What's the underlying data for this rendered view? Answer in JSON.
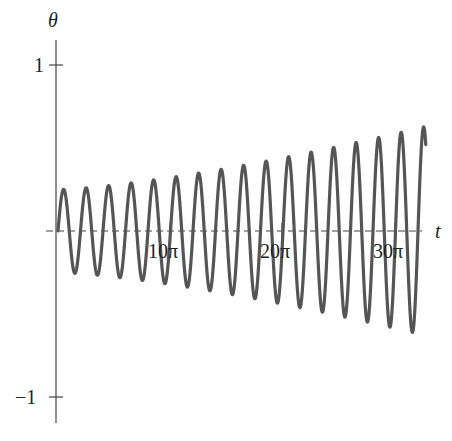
{
  "chart_data": {
    "type": "line",
    "title": "",
    "xlabel": "t",
    "ylabel": "θ",
    "xlim": [
      0,
      102.7
    ],
    "ylim": [
      -1.1,
      1.1
    ],
    "x_ticks": [
      {
        "value": 31.416,
        "label": "10π"
      },
      {
        "value": 62.832,
        "label": "20π"
      },
      {
        "value": 94.248,
        "label": "30π"
      }
    ],
    "y_ticks": [
      {
        "value": 1,
        "label": "1"
      },
      {
        "value": -1,
        "label": "−1"
      }
    ],
    "grid": false,
    "legend": null,
    "x_axis_style": "dashed",
    "series": [
      {
        "name": "θ(t)",
        "color": "#555555",
        "description": "oscillation with period 2π and slowly growing amplitude",
        "model": {
          "form": "A(t)·sin(t)",
          "amplitude_start": 0.25,
          "amplitude_end": 0.63,
          "t_start": 0,
          "t_end": 102.7
        },
        "x": [
          0,
          1.57,
          4.71,
          7.85,
          11.0,
          14.1,
          17.3,
          20.4,
          23.6,
          26.7,
          29.8,
          33.0,
          36.1,
          39.3,
          42.4,
          45.6,
          48.7,
          51.8,
          55.0,
          58.1,
          61.3,
          64.4,
          67.5,
          70.7,
          73.8,
          77.0,
          80.1,
          83.3,
          86.4,
          89.5,
          92.7,
          95.8,
          99.0,
          102.1,
          102.7
        ],
        "values": [
          0,
          0.25,
          -0.26,
          0.26,
          -0.27,
          0.27,
          -0.28,
          0.29,
          -0.3,
          0.31,
          -0.32,
          0.33,
          -0.34,
          0.35,
          -0.36,
          0.37,
          -0.38,
          0.4,
          -0.41,
          0.42,
          -0.44,
          0.45,
          -0.47,
          0.48,
          -0.5,
          0.51,
          -0.53,
          0.54,
          -0.56,
          0.57,
          -0.59,
          0.6,
          -0.62,
          0.63,
          -0.49
        ]
      }
    ]
  },
  "axes": {
    "x_label": "t",
    "y_label": "θ",
    "x_tick_labels": [
      "10π",
      "20π",
      "30π"
    ],
    "y_tick_labels": [
      "1",
      "−1"
    ]
  }
}
